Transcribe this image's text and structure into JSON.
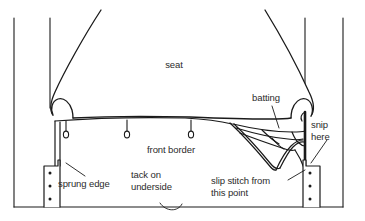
{
  "diagram": {
    "stroke_color": "#1a1a1a",
    "text_color": "#2b2b2b",
    "background_color": "#ffffff",
    "labels": {
      "seat": "seat",
      "batting": "batting",
      "snip_here": "snip\nhere",
      "front_border": "front border",
      "sprung_edge": "sprung edge",
      "tack_on_underside": "tack on\nunderside",
      "slip_stitch": "slip stitch from\nthis point"
    },
    "parts": [
      {
        "name": "seat-cushion",
        "label": "seat"
      },
      {
        "name": "batting-layer",
        "label": "batting"
      },
      {
        "name": "front-border-panel",
        "label": "front border"
      },
      {
        "name": "sprung-edge",
        "label": "sprung edge"
      },
      {
        "name": "tack-underside",
        "label": "tack on underside"
      },
      {
        "name": "slip-stitch-start",
        "label": "slip stitch from this point"
      },
      {
        "name": "snip-point",
        "label": "snip here"
      }
    ],
    "tack_pins": [
      {
        "x": 66,
        "y": 135
      },
      {
        "x": 127,
        "y": 135
      },
      {
        "x": 191,
        "y": 135
      }
    ],
    "left_leg_tacks": [
      {
        "x": 50,
        "y": 173
      },
      {
        "x": 50,
        "y": 186
      },
      {
        "x": 50,
        "y": 199
      }
    ],
    "right_leg_tacks": [
      {
        "x": 310,
        "y": 173
      },
      {
        "x": 310,
        "y": 186
      },
      {
        "x": 310,
        "y": 199
      }
    ]
  }
}
